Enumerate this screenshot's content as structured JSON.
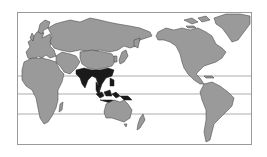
{
  "map": {
    "projection": "pacific-centered world map",
    "colors": {
      "background": "#ffffff",
      "land": "#9a9a9a",
      "border": "#3a3a3a",
      "highlight": "#1a1a1a",
      "latitude_lines": "#8a8a8a"
    },
    "latitude_lines": [
      "tropic-of-cancer",
      "equator",
      "tropic-of-capricorn"
    ],
    "highlighted_regions": [
      "India",
      "Bangladesh",
      "Myanmar",
      "Thailand",
      "Laos",
      "Cambodia",
      "Vietnam",
      "Southern China",
      "Malaysia",
      "Indonesia",
      "Philippines"
    ]
  }
}
